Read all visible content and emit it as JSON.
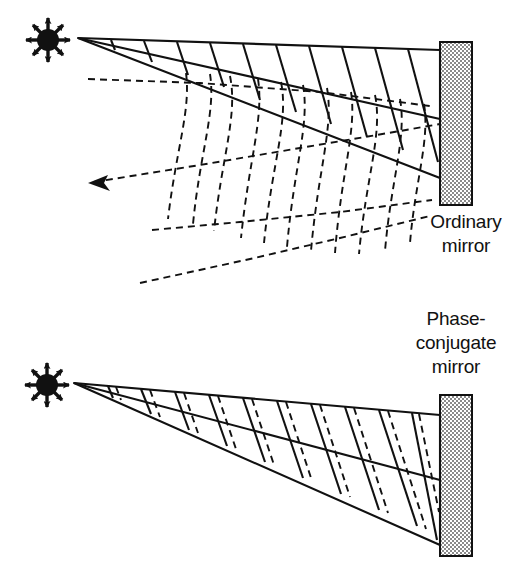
{
  "figure": {
    "background_color": "#ffffff",
    "line_color": "#111111",
    "mirror_fill": "#d9d9d9",
    "mirror_stroke": "#111111"
  },
  "panels": [
    {
      "id": "ordinary",
      "label_lines": [
        "Ordinary",
        "mirror"
      ],
      "label_x": 466,
      "label_y_start": 228,
      "label_line_height": 24,
      "source": {
        "name": "point-light-source",
        "cx": 48,
        "cy": 40,
        "radius": 11,
        "ray_count": 8,
        "ray_length": 19
      },
      "mirror": {
        "x": 440,
        "y": 42,
        "width": 32,
        "height": 163
      },
      "incident_beam": {
        "apex_x": 78,
        "apex_y": 38,
        "top_end_x": 440,
        "top_end_y": 50,
        "bottom_end_x": 440,
        "bottom_end_y": 178,
        "wavefront_count": 11,
        "style": "solid"
      },
      "reflected_beam": {
        "arrow_tip_x": 88,
        "arrow_tip_y": 183,
        "upper_edge_start_x": 88,
        "upper_edge_start_y": 79,
        "lower_edge_end_x": 140,
        "lower_edge_end_y": 283,
        "wavefront_count": 9,
        "style": "dashed",
        "note": "distorted / scrambled wavefronts spread away from original direction"
      }
    },
    {
      "id": "phase-conjugate",
      "label_lines": [
        "Phase-",
        "conjugate",
        "mirror"
      ],
      "label_x": 456,
      "label_y_start": 325,
      "label_line_height": 24,
      "source": {
        "name": "point-light-source",
        "cx": 47,
        "cy": 385,
        "radius": 11,
        "ray_count": 8,
        "ray_length": 19
      },
      "mirror": {
        "x": 440,
        "y": 395,
        "width": 32,
        "height": 161
      },
      "incident_beam": {
        "apex_x": 74,
        "apex_y": 383,
        "top_end_x": 440,
        "top_end_y": 415,
        "bottom_end_x": 440,
        "bottom_end_y": 545,
        "wavefront_count": 10,
        "style": "solid"
      },
      "reflected_beam": {
        "style": "dashed",
        "wavefront_count": 10,
        "note": "reflected wavefronts retrace the incident path exactly"
      }
    }
  ]
}
